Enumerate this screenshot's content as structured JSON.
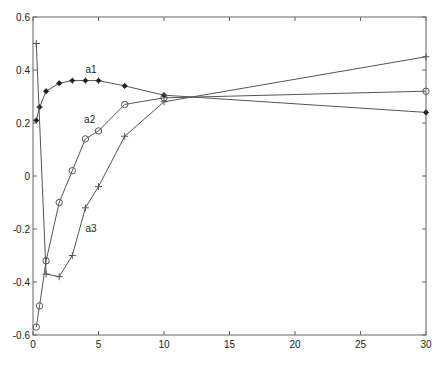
{
  "chart_data": {
    "type": "line",
    "title": "",
    "xlabel": "",
    "ylabel": "",
    "xlim": [
      0,
      30
    ],
    "ylim": [
      -0.6,
      0.6
    ],
    "xticks": [
      0,
      5,
      10,
      15,
      20,
      25,
      30
    ],
    "yticks": [
      -0.6,
      -0.4,
      -0.2,
      0,
      0.2,
      0.4,
      0.6
    ],
    "xtick_labels": [
      "0",
      "5",
      "10",
      "15",
      "20",
      "25",
      "30"
    ],
    "ytick_labels": [
      "-0.6",
      "-0.4",
      "-0.2",
      "0",
      "0.2",
      "0.4",
      "0.6"
    ],
    "grid": false,
    "legend": null,
    "line_color": "#555555",
    "series": [
      {
        "name": "a1",
        "marker": "*",
        "label_pos": [
          4.0,
          0.39
        ],
        "x": [
          0.25,
          0.5,
          1,
          2,
          3,
          4,
          5,
          7,
          10,
          30
        ],
        "values": [
          0.21,
          0.26,
          0.32,
          0.35,
          0.36,
          0.36,
          0.36,
          0.34,
          0.305,
          0.24
        ]
      },
      {
        "name": "a2",
        "marker": "o",
        "label_pos": [
          3.9,
          0.2
        ],
        "x": [
          0.25,
          0.5,
          1,
          2,
          3,
          4,
          5,
          7,
          10,
          30
        ],
        "values": [
          -0.57,
          -0.49,
          -0.32,
          -0.1,
          0.02,
          0.14,
          0.17,
          0.27,
          0.295,
          0.32
        ]
      },
      {
        "name": "a3",
        "marker": "+",
        "label_pos": [
          4.0,
          -0.21
        ],
        "x": [
          0.25,
          1,
          2,
          3,
          4,
          5,
          7,
          10,
          30
        ],
        "values": [
          0.5,
          -0.37,
          -0.38,
          -0.3,
          -0.12,
          -0.04,
          0.15,
          0.28,
          0.45
        ]
      }
    ]
  },
  "plot_box": {
    "left": 33,
    "top": 17,
    "right": 426,
    "bottom": 335
  }
}
